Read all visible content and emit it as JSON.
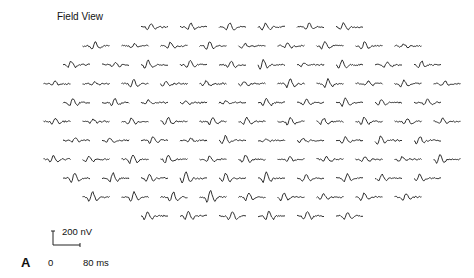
{
  "figure": {
    "title": "Field View",
    "panel_label": "A",
    "scale_bar": {
      "voltage_label": "200 nV",
      "time_start_label": "0",
      "time_end_label": "80 ms"
    },
    "trace_color": "#1a1a1a"
  },
  "chart_data": {
    "type": "line",
    "title": "Field View",
    "rows_trace_counts": [
      6,
      9,
      10,
      11,
      10,
      11,
      10,
      11,
      10,
      9,
      6
    ],
    "total_traces": 103,
    "scale": {
      "amplitude": "200 nV",
      "time": "80 ms"
    }
  }
}
